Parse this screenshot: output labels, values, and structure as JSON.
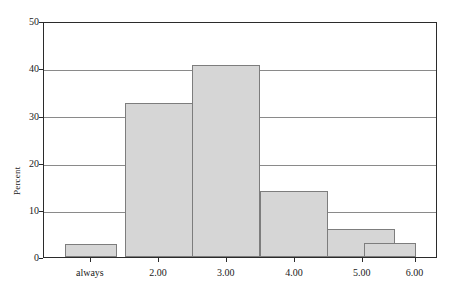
{
  "chart_data": {
    "type": "bar",
    "title": "",
    "subtitle": "",
    "xlabel": "",
    "ylabel": "Percent",
    "categories": [
      "always",
      "2.00",
      "3.00",
      "4.00",
      "5.00",
      "6.00"
    ],
    "values": [
      2.7,
      33.0,
      41.0,
      14.0,
      6.0,
      3.0
    ],
    "ylim": [
      0,
      50
    ],
    "yticks": [
      0,
      10,
      20,
      30,
      40,
      50
    ],
    "ytick_labels": [
      "0",
      "10",
      "20",
      "30",
      "40",
      "50"
    ],
    "grid": true,
    "grid_axis": "y",
    "legend": false,
    "legend_position": "none",
    "bar_fill_color": "#d6d6d6",
    "bar_edge_color": "#7d7d7d",
    "frame_color": "#2b2b2b",
    "gridline_color": "#8a8a8a",
    "background_color": "#ffffff"
  },
  "bars": [
    {
      "category": "always",
      "value": 2.7,
      "left_pct": 5.3,
      "width_pct": 13.2
    },
    {
      "category": "2.00",
      "value": 33.0,
      "left_pct": 20.6,
      "width_pct": 17.3
    },
    {
      "category": "3.00",
      "value": 41.0,
      "left_pct": 37.8,
      "width_pct": 17.3
    },
    {
      "category": "4.00",
      "value": 14.0,
      "left_pct": 55.1,
      "width_pct": 17.3
    },
    {
      "category": "5.00",
      "value": 6.0,
      "left_pct": 72.3,
      "width_pct": 17.3
    },
    {
      "category": "6.00",
      "value": 3.0,
      "left_pct": 81.7,
      "width_pct": 13.2
    }
  ],
  "tick_positions": {
    "x_pct": [
      11.9,
      29.2,
      46.4,
      63.7,
      80.9,
      94.3
    ]
  }
}
